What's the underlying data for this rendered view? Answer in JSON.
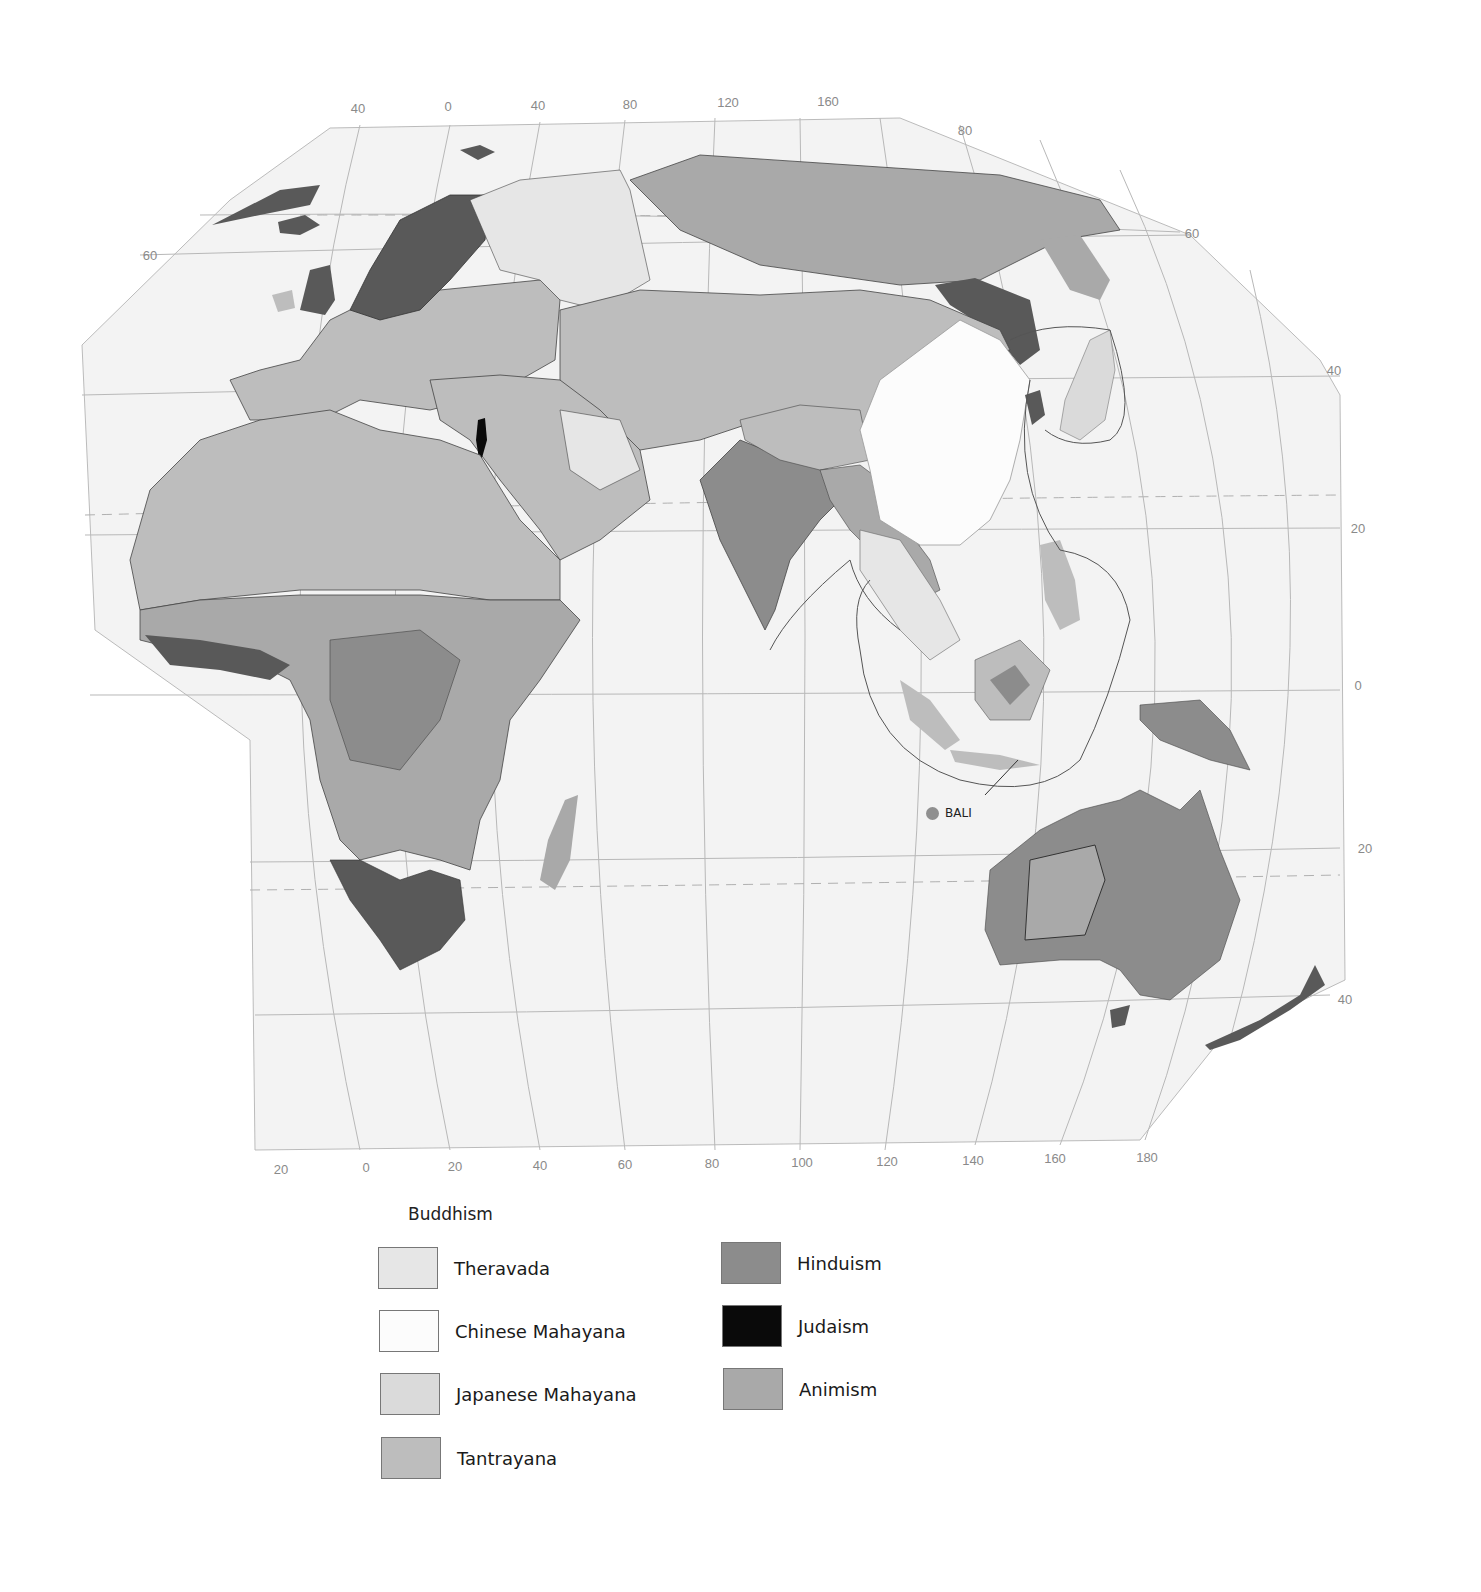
{
  "map": {
    "title": "Buddhism",
    "colors": {
      "ocean": "#f3f3f3",
      "theravada": "#e6e6e6",
      "chinese_mahayana": "#fcfcfc",
      "japanese_mahayana": "#dadada",
      "tantrayana": "#bdbdbd",
      "hinduism": "#8c8c8c",
      "judaism": "#0a0a0a",
      "animism": "#a9a9a9",
      "christian_dark": "#595959",
      "grid": "#b8b8b8",
      "border": "#444444"
    },
    "longitude_ticks_top": [
      "40",
      "0",
      "40",
      "80",
      "120",
      "160"
    ],
    "longitude_ticks_bottom": [
      "20",
      "0",
      "20",
      "40",
      "60",
      "80",
      "100",
      "120",
      "140",
      "160",
      "180"
    ],
    "latitude_ticks_left": [
      "60"
    ],
    "latitude_ticks_right": [
      "80",
      "60",
      "40",
      "20",
      "0",
      "20",
      "40"
    ],
    "annotations": [
      {
        "label": "BALI",
        "marker": "dot"
      }
    ]
  },
  "legend": {
    "title": "Buddhism",
    "items": [
      {
        "label": "Theravada",
        "color": "#e6e6e6"
      },
      {
        "label": "Chinese Mahayana",
        "color": "#fcfcfc"
      },
      {
        "label": "Japanese Mahayana",
        "color": "#dadada"
      },
      {
        "label": "Tantrayana",
        "color": "#bdbdbd"
      },
      {
        "label": "Hinduism",
        "color": "#8c8c8c"
      },
      {
        "label": "Judaism",
        "color": "#0a0a0a"
      },
      {
        "label": "Animism",
        "color": "#a9a9a9"
      }
    ]
  }
}
